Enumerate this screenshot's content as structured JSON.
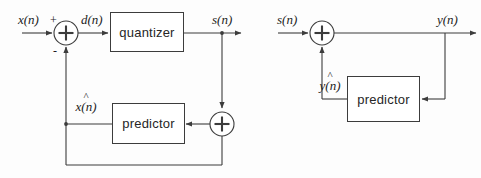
{
  "diagram": {
    "line_color": "#3c3c3c",
    "text_color": "#1c1c1c",
    "background": "#fdfdfd"
  },
  "encoder": {
    "name": "encoder",
    "input_label": "x(n)",
    "plus_sign": "+",
    "minus_sign": "-",
    "difference_label": "d(n)",
    "quantizer_label": "quantizer",
    "output_label": "s(n)",
    "predictor_label": "predictor",
    "prediction_hat": "^",
    "prediction_base": "x(n)",
    "adder_glyph": "+"
  },
  "decoder": {
    "name": "decoder",
    "input_label": "s(n)",
    "output_label": "y(n)",
    "predictor_label": "predictor",
    "prediction_hat": "^",
    "prediction_base": "y(n)",
    "adder_glyph": "+"
  }
}
